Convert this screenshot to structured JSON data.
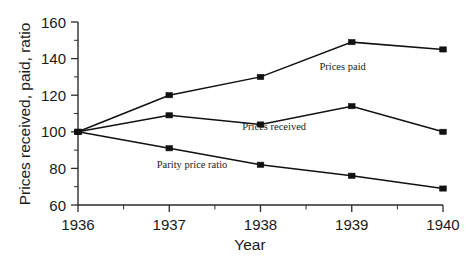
{
  "chart_data": {
    "type": "line",
    "title": "",
    "xlabel": "Year",
    "ylabel": "Prices received, paid, ratio",
    "x": [
      1936,
      1937,
      1938,
      1939,
      1940
    ],
    "xticklabels": [
      "1936",
      "1937",
      "1938",
      "1939",
      "1940"
    ],
    "yticklabels": [
      "60",
      "80",
      "100",
      "120",
      "140",
      "160"
    ],
    "yticks": [
      60,
      80,
      100,
      120,
      140,
      160
    ],
    "ylim": [
      60,
      160
    ],
    "xlim": [
      1936,
      1940
    ],
    "grid": false,
    "legend": "inline-annotations",
    "marker": "filled-square",
    "series": [
      {
        "name": "Prices paid",
        "values": [
          100,
          120,
          130,
          149,
          145
        ],
        "annotation": "Prices paid",
        "annotation_x": 1938.9,
        "annotation_y": 134
      },
      {
        "name": "Prices received",
        "values": [
          100,
          109,
          104,
          114,
          100
        ],
        "annotation": "Prices received",
        "annotation_x": 1938.15,
        "annotation_y": 101
      },
      {
        "name": "Parity price ratio",
        "values": [
          100,
          91,
          82,
          76,
          69
        ],
        "annotation": "Parity price ratio",
        "annotation_x": 1937.25,
        "annotation_y": 80
      }
    ],
    "colors": {
      "line": "#111111",
      "marker": "#111111",
      "axis": "#2b2b2b",
      "background": "#ffffff",
      "text": "#1a1a1a"
    }
  }
}
